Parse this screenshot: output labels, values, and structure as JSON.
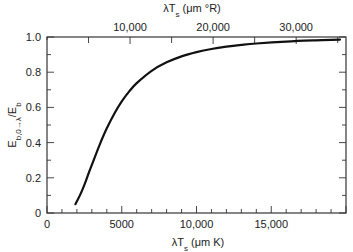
{
  "chart_data": {
    "type": "line",
    "title": "",
    "xlabel": "λT_s (μm K)",
    "xlabel_top": "λT_s (μm °R)",
    "ylabel": "E_b,0→λ / E_b",
    "xlim": [
      0,
      20000
    ],
    "ylim": [
      0,
      1.0
    ],
    "grid": false,
    "legend": null,
    "x_ticks_bottom": {
      "major": [
        0,
        5000,
        10000,
        15000
      ],
      "labels": [
        "0",
        "5000",
        "10,000",
        "15,000"
      ],
      "minor_step": 1000
    },
    "x_ticks_top": {
      "unit": "μm °R",
      "conversion_factor_to_K": 0.5556,
      "major": [
        10000,
        20000,
        30000
      ],
      "labels": [
        "10,000",
        "20,000",
        "30,000"
      ],
      "minor_step": 5000,
      "max": 36000
    },
    "y_ticks": {
      "major": [
        0,
        0.2,
        0.4,
        0.6,
        0.8,
        1.0
      ],
      "labels": [
        "0",
        "0.2",
        "0.4",
        "0.6",
        "0.8",
        "1.0"
      ],
      "minor_step": 0.1
    },
    "series": [
      {
        "name": "Blackbody fraction E_b,0→λ / E_b",
        "x": [
          1900,
          2200,
          2500,
          2800,
          3000,
          3500,
          4000,
          4500,
          5000,
          5500,
          6000,
          7000,
          8000,
          9000,
          10000,
          11000,
          12000,
          13000,
          14000,
          16000,
          18000,
          19600
        ],
        "values": [
          0.05,
          0.1,
          0.16,
          0.23,
          0.273,
          0.383,
          0.481,
          0.564,
          0.634,
          0.691,
          0.738,
          0.808,
          0.856,
          0.89,
          0.914,
          0.932,
          0.945,
          0.955,
          0.963,
          0.974,
          0.981,
          0.985
        ]
      }
    ]
  }
}
